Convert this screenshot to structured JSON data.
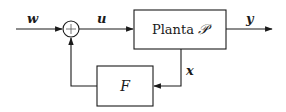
{
  "diagram": {
    "type": "feedback-block-diagram",
    "signals": {
      "input": "w",
      "control": "u",
      "output": "y",
      "state": "x"
    },
    "blocks": {
      "plant": {
        "label_text": "Planta ",
        "label_symbol": "𝒫"
      },
      "feedback": {
        "label": "F"
      }
    },
    "summing_junction": {
      "symbol": "+"
    },
    "colors": {
      "stroke": "#1a1a1a",
      "background": "#ffffff"
    }
  }
}
